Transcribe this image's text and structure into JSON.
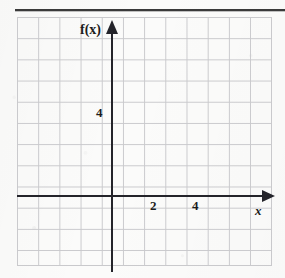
{
  "figure": {
    "kind": "blank-coordinate-grid",
    "width": 285,
    "height": 278,
    "background_color": "#fbfbfa",
    "grid_line_color": "#c9c9cc",
    "axis_color": "#24242a",
    "rule_color": "#3a3a3a"
  },
  "chart_data": {
    "type": "scatter",
    "title": "",
    "xlabel": "x",
    "ylabel": "f(x)",
    "x": [],
    "y": [],
    "series": [],
    "xlim": [
      -4.5,
      7.5
    ],
    "ylim": [
      -3.3,
      8.4
    ],
    "xticks": [
      2,
      4
    ],
    "yticks": [
      4
    ],
    "xtick_labels": [
      "2",
      "4"
    ],
    "ytick_labels": [
      "4"
    ],
    "grid": true,
    "grid_spacing_units": 1,
    "legend": "none",
    "annotations": []
  },
  "axes": {
    "y_axis_label": "f(x)",
    "x_axis_label": "x",
    "y_tick_label_4": "4",
    "x_tick_label_2": "2",
    "x_tick_label_4": "4"
  }
}
